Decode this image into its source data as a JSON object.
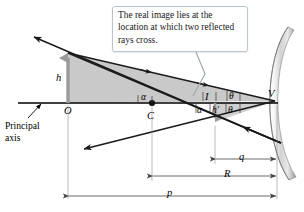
{
  "figure": {
    "background_color": "#ffffff"
  },
  "callout": {
    "text": "The real image lies at the location at which two reflected rays cross.",
    "border_color": "#b9c4cc",
    "fill_color": "#ffffff"
  },
  "labels": {
    "object_height": "h",
    "image_height": "h′",
    "vertex": "V",
    "center_of_curvature": "C",
    "object_point": "O",
    "image_point": "I",
    "alpha_upper": "α",
    "alpha_lower": "α",
    "theta_upper": "θ",
    "theta_lower": "θ",
    "principal_axis": "Principal\naxis",
    "principal_axis_line1": "Principal",
    "principal_axis_line2": "axis"
  },
  "dimensions": {
    "image_distance": "q",
    "radius_of_curvature": "R",
    "object_distance": "p"
  },
  "colors": {
    "shade_fill": "#c9c9c9",
    "shade_fill_light": "#d6d6d6",
    "ray_line": "#1a1a1a",
    "axis_line": "#000000",
    "dimension_line": "#555555",
    "mirror_light": "#f2f2f2",
    "mirror_mid": "#cfcfcf",
    "mirror_dark": "#9a9a9a",
    "object_arrow": "#9a9a9a",
    "image_arrow": "#9a9a9a"
  },
  "geometry": {
    "vertex_point": [
      275,
      101
    ],
    "object_base_point": [
      68,
      103
    ],
    "object_tip_point": [
      68,
      53
    ],
    "center_point": [
      152,
      103
    ],
    "image_point": [
      215,
      122
    ],
    "principal_axis_y": 103
  }
}
